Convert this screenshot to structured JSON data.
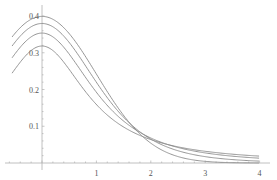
{
  "chart_data": {
    "type": "line",
    "title": "",
    "xlabel": "",
    "ylabel": "",
    "xlim": [
      -0.55,
      4.0
    ],
    "ylim": [
      0,
      0.42
    ],
    "grid": false,
    "legend": null,
    "x_ticks": [
      1,
      2,
      3,
      4
    ],
    "x_tick_labels": [
      "1",
      "2",
      "3",
      "4"
    ],
    "y_ticks": [
      0.1,
      0.2,
      0.3,
      0.4
    ],
    "y_tick_labels": [
      "0.1",
      "0.2",
      "0.3",
      "0.4"
    ],
    "series": [
      {
        "name": "normal",
        "peak": 0.4,
        "dist": "t",
        "df": 0
      },
      {
        "name": "t df=5",
        "peak": 0.38,
        "dist": "t",
        "df": 5
      },
      {
        "name": "t df=2",
        "peak": 0.354,
        "dist": "t",
        "df": 2
      },
      {
        "name": "t df=1",
        "peak": 0.318,
        "dist": "t",
        "df": 1
      }
    ],
    "annotations": [
      "curves cross near x≈1.85, y≈0.077"
    ],
    "line_color": "#8a8a8a",
    "axis_color": "#b0b0b0"
  }
}
